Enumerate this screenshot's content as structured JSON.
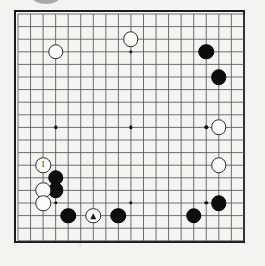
{
  "diagram": {
    "type": "go-board-diagram",
    "title": "",
    "board_size": 19,
    "background_color": "#f4f3f0",
    "line_color": "#555555",
    "border_color": "#1b1b1b",
    "black_color": "#0d0d0d",
    "white_color": "#fbfbfa",
    "geometry": {
      "board_left": 14,
      "board_top": 10,
      "board_width": 231,
      "board_height": 233,
      "inset": 2,
      "step_x": 12.55,
      "step_y": 12.6
    },
    "star_points": [
      {
        "col": 3,
        "row": 3
      },
      {
        "col": 9,
        "row": 3
      },
      {
        "col": 15,
        "row": 3
      },
      {
        "col": 3,
        "row": 9
      },
      {
        "col": 9,
        "row": 9
      },
      {
        "col": 15,
        "row": 9
      },
      {
        "col": 3,
        "row": 15
      },
      {
        "col": 9,
        "row": 15
      },
      {
        "col": 15,
        "row": 15
      }
    ],
    "stones": [
      {
        "id": "w-top-left",
        "color": "white",
        "col": 3,
        "row": 3,
        "label": "",
        "mark": "none"
      },
      {
        "id": "w-top-center",
        "color": "white",
        "col": 9,
        "row": 2,
        "label": "",
        "mark": "none"
      },
      {
        "id": "b-top-right-upper",
        "color": "black",
        "col": 15,
        "row": 3,
        "label": "",
        "mark": "none"
      },
      {
        "id": "b-top-right-lower",
        "color": "black",
        "col": 16,
        "row": 5,
        "label": "",
        "mark": "none"
      },
      {
        "id": "w-right-upper",
        "color": "white",
        "col": 16,
        "row": 9,
        "label": "",
        "mark": "none"
      },
      {
        "id": "w-right-lower",
        "color": "white",
        "col": 16,
        "row": 12,
        "label": "",
        "mark": "none"
      },
      {
        "id": "w-move-one",
        "color": "white",
        "col": 2,
        "row": 12,
        "label": "1",
        "mark": "number"
      },
      {
        "id": "b-left-upper",
        "color": "black",
        "col": 3,
        "row": 13,
        "label": "",
        "mark": "none"
      },
      {
        "id": "b-left-lower",
        "color": "black",
        "col": 3,
        "row": 14,
        "label": "",
        "mark": "none"
      },
      {
        "id": "w-left-mid",
        "color": "white",
        "col": 2,
        "row": 14,
        "label": "",
        "mark": "none"
      },
      {
        "id": "w-left-low",
        "color": "white",
        "col": 2,
        "row": 15,
        "label": "",
        "mark": "none"
      },
      {
        "id": "b-bottom-a",
        "color": "black",
        "col": 4,
        "row": 16,
        "label": "",
        "mark": "none"
      },
      {
        "id": "w-triangle",
        "color": "white",
        "col": 6,
        "row": 16,
        "label": "",
        "mark": "triangle"
      },
      {
        "id": "b-bottom-b",
        "color": "black",
        "col": 8,
        "row": 16,
        "label": "",
        "mark": "none"
      },
      {
        "id": "b-bottom-right",
        "color": "black",
        "col": 14,
        "row": 16,
        "label": "",
        "mark": "none"
      },
      {
        "id": "b-right-corner",
        "color": "black",
        "col": 16,
        "row": 15,
        "label": "",
        "mark": "none"
      }
    ],
    "counts": {
      "black_stones": 8,
      "white_stones": 8,
      "total_stones": 16
    }
  }
}
